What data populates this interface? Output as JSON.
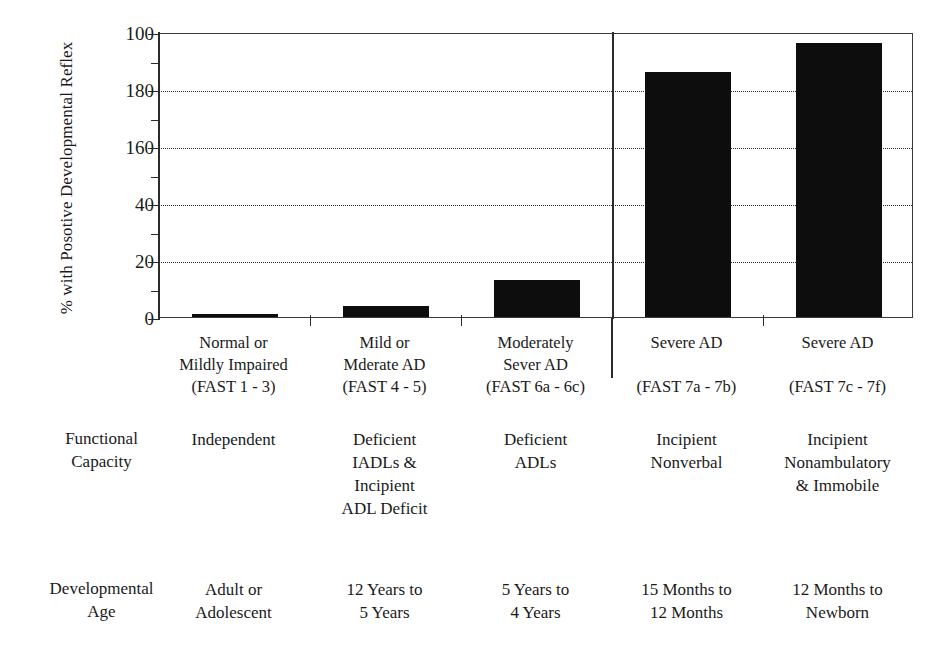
{
  "chart_data": {
    "type": "bar",
    "title": "",
    "xlabel": "",
    "ylabel": "% with Posotive Developmental Reflex",
    "ylim": [
      0,
      100
    ],
    "ytick_labels": [
      "100",
      "180",
      "160",
      "40",
      "20",
      "0"
    ],
    "ytick_values": [
      100,
      80,
      60,
      40,
      20,
      0
    ],
    "minor_tick_values": [
      90,
      70,
      50,
      30,
      10
    ],
    "gridlines_at": [
      80,
      60,
      40,
      20
    ],
    "grid": true,
    "legend": "none",
    "categories": [
      "Normal or Mildly Impaired (FAST 1 - 3)",
      "Mild or Mderate AD (FAST 4 - 5)",
      "Moderately Sever AD (FAST 6a - 6c)",
      "Severe AD (FAST 7a - 7b)",
      "Severe AD (FAST 7c - 7f)"
    ],
    "values": [
      1,
      4,
      13,
      86,
      96
    ],
    "bar_color": "#0d0d0d",
    "axis_color": "#2b2b2b",
    "separator_after_category_index": 2
  },
  "axis": {
    "ylabel": "% with Posotive Developmental Reflex",
    "ticks": [
      {
        "label": "100",
        "value": 100,
        "major": true,
        "grid": false
      },
      {
        "label": "",
        "value": 90,
        "major": false,
        "grid": false
      },
      {
        "label": "180",
        "value": 80,
        "major": true,
        "grid": true
      },
      {
        "label": "",
        "value": 70,
        "major": false,
        "grid": false
      },
      {
        "label": "160",
        "value": 60,
        "major": true,
        "grid": true
      },
      {
        "label": "",
        "value": 50,
        "major": false,
        "grid": false
      },
      {
        "label": "40",
        "value": 40,
        "major": true,
        "grid": true
      },
      {
        "label": "",
        "value": 30,
        "major": false,
        "grid": false
      },
      {
        "label": "20",
        "value": 20,
        "major": true,
        "grid": true
      },
      {
        "label": "",
        "value": 10,
        "major": false,
        "grid": false
      },
      {
        "label": "0",
        "value": 0,
        "major": true,
        "grid": false
      }
    ]
  },
  "categories": [
    {
      "lines": [
        "Normal or",
        "Mildly Impaired",
        "(FAST 1 - 3)"
      ]
    },
    {
      "lines": [
        "Mild or",
        "Mderate AD",
        "(FAST 4 - 5)"
      ]
    },
    {
      "lines": [
        "Moderately",
        "Sever AD",
        "(FAST 6a - 6c)"
      ]
    },
    {
      "lines": [
        "Severe AD",
        "",
        "(FAST 7a - 7b)"
      ]
    },
    {
      "lines": [
        "Severe AD",
        "",
        "(FAST 7c - 7f)"
      ]
    }
  ],
  "rows": [
    {
      "head": [
        "Functional",
        "Capacity"
      ],
      "cells": [
        {
          "lines": [
            "Independent"
          ]
        },
        {
          "lines": [
            "Deficient",
            "IADLs &",
            "Incipient",
            "ADL Deficit"
          ]
        },
        {
          "lines": [
            "Deficient",
            "ADLs"
          ]
        },
        {
          "lines": [
            "Incipient",
            "Nonverbal"
          ]
        },
        {
          "lines": [
            "Incipient",
            "Nonambulatory",
            "& Immobile"
          ]
        }
      ]
    },
    {
      "head": [
        "Developmental",
        "Age"
      ],
      "cells": [
        {
          "lines": [
            "Adult  or",
            "Adolescent"
          ]
        },
        {
          "lines": [
            "12 Years to",
            "5 Years"
          ]
        },
        {
          "lines": [
            "5 Years to",
            "4 Years"
          ]
        },
        {
          "lines": [
            "15 Months to",
            "12 Months"
          ]
        },
        {
          "lines": [
            "12 Months to",
            "Newborn"
          ]
        }
      ]
    }
  ]
}
